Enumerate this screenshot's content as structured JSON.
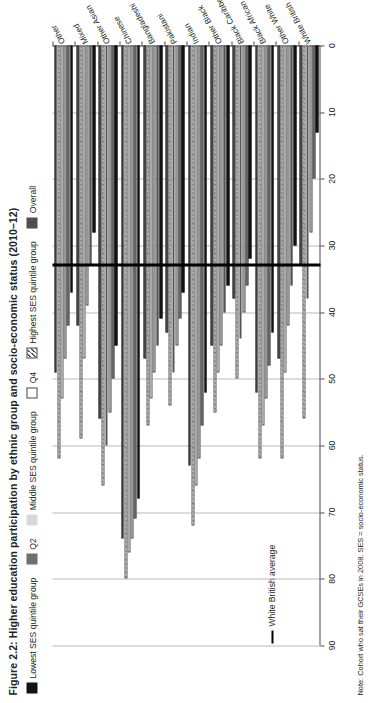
{
  "figure": {
    "title": "Figure 2.2: Higher education participation by ethnic group and socio-economic status (2010–12)",
    "note": "Note: Cohort who sat their GCSEs in 2008. SES = socio-economic status."
  },
  "legend": {
    "items": [
      {
        "label": "Lowest SES quintile group",
        "swatch": "c0",
        "color": "#121212"
      },
      {
        "label": "Q2",
        "swatch": "c1",
        "color": "#6f6f6f"
      },
      {
        "label": "Middle SES quintile group",
        "swatch": "c2",
        "color": "#d9d9d9"
      },
      {
        "label": "Q4",
        "swatch": "c3",
        "color": "#ffffff"
      },
      {
        "label": "Highest SES quintile group",
        "swatch": "c4",
        "color": "#ffffff"
      },
      {
        "label": "Overall",
        "swatch": "c5",
        "color": "#4f4f4f"
      }
    ],
    "reference": {
      "label": "White British average",
      "swatch": "line",
      "color": "#000000"
    }
  },
  "chart_data": {
    "type": "bar",
    "orientation": "horizontal",
    "title": "Figure 2.2: Higher education participation by ethnic group and socio-economic status (2010–12)",
    "xlabel": "",
    "ylabel": "",
    "xlim": [
      0,
      90
    ],
    "ticks": [
      0,
      10,
      20,
      30,
      40,
      50,
      60,
      70,
      80,
      90
    ],
    "grid": true,
    "legend_position": "top",
    "reference_line": {
      "label": "White British average",
      "value": 33,
      "color": "#000000"
    },
    "categories": [
      "White British",
      "Other White",
      "Black African",
      "Black Caribbean",
      "Other Black",
      "Indian",
      "Pakistani",
      "Bangladeshi",
      "Chinese",
      "Other Asian",
      "Mixed",
      "Other"
    ],
    "series": [
      {
        "name": "Lowest SES quintile group",
        "color": "#121212",
        "values": [
          13,
          30,
          43,
          32,
          36,
          52,
          37,
          41,
          68,
          45,
          28,
          37
        ]
      },
      {
        "name": "Q2",
        "color": "#6f6f6f",
        "values": [
          20,
          36,
          48,
          36,
          40,
          57,
          41,
          45,
          71,
          50,
          33,
          42
        ]
      },
      {
        "name": "Middle SES quintile group",
        "color": "#d9d9d9",
        "values": [
          28,
          42,
          53,
          40,
          45,
          62,
          45,
          49,
          74,
          55,
          39,
          47
        ]
      },
      {
        "name": "Q4",
        "color": "#ffffff",
        "values": [
          38,
          49,
          57,
          44,
          49,
          66,
          49,
          53,
          76,
          60,
          47,
          53
        ]
      },
      {
        "name": "Highest SES quintile group",
        "color": "#ffffff",
        "values": [
          56,
          62,
          62,
          50,
          55,
          72,
          54,
          57,
          80,
          66,
          59,
          62
        ]
      },
      {
        "name": "Overall",
        "color": "#4f4f4f",
        "values": [
          33,
          47,
          52,
          38,
          45,
          63,
          43,
          47,
          74,
          56,
          42,
          49
        ]
      }
    ]
  }
}
